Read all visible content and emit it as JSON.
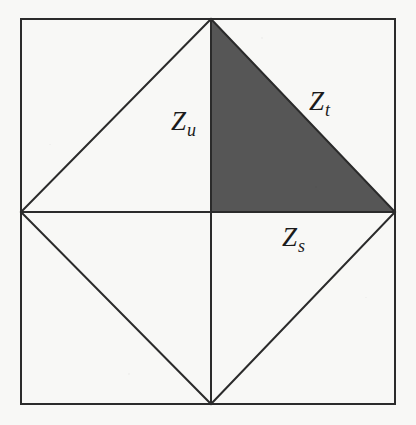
{
  "figure": {
    "caption_labels": {
      "zu": {
        "base": "Z",
        "sub": "u"
      },
      "zt": {
        "base": "Z",
        "sub": "t"
      },
      "zs": {
        "base": "Z",
        "sub": "s"
      }
    },
    "colors": {
      "background": "#f8f8f6",
      "stroke": "#2b2b2b",
      "shaded_region": "#565656"
    },
    "geometry": {
      "square": {
        "left": 21,
        "top": 19,
        "right": 395,
        "bottom": 404
      },
      "center": {
        "x": 211,
        "y": 212
      },
      "top_apex": {
        "x": 211,
        "y": 19
      },
      "bottom_apex": {
        "x": 211,
        "y": 404
      },
      "left_mid": {
        "x": 21,
        "y": 212
      },
      "right_mid": {
        "x": 395,
        "y": 212
      },
      "stroke_width": 2,
      "shaded_triangle": [
        [
          211,
          19
        ],
        [
          395,
          212
        ],
        [
          211,
          212
        ]
      ]
    }
  }
}
